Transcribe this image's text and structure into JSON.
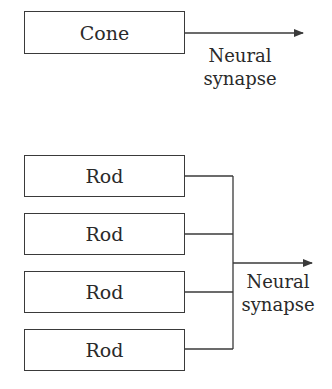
{
  "top": {
    "cell": "Cone",
    "output_label_line1": "Neural",
    "output_label_line2": "synapse"
  },
  "bottom": {
    "cells": [
      "Rod",
      "Rod",
      "Rod",
      "Rod"
    ],
    "output_label_line1": "Neural",
    "output_label_line2": "synapse"
  },
  "colors": {
    "line": "#3a3a3a",
    "text": "#2a2a2a",
    "background": "#ffffff"
  }
}
